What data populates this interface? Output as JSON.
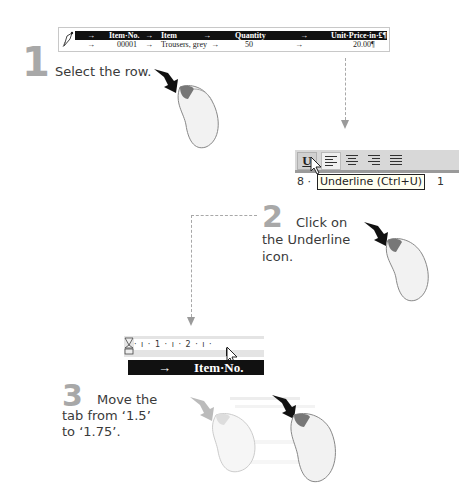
{
  "step1": {
    "number": "1",
    "instruction": "Select the row.",
    "table": {
      "header": {
        "tab1": "→",
        "item_no": "Item·No.",
        "tab2": "→",
        "item": "Item",
        "tab3": "→",
        "quantity": "Quantity",
        "tab4": "→",
        "unit_price": "Unit·Price·in·£¶"
      },
      "row": {
        "tab1": "→",
        "item_no": "00001",
        "tab2": "→",
        "item": "Trousers, grey",
        "tab3": "→",
        "quantity": "50",
        "tab4": "→",
        "unit_price": "20.00¶"
      }
    }
  },
  "step2": {
    "number": "2",
    "instruction_line1": "Click on",
    "instruction_line2": "the Underline",
    "instruction_line3": "icon.",
    "toolbar": {
      "underline_label": "U",
      "ruler_left": "8 ·",
      "ruler_right": "1",
      "tooltip": "Underline (Ctrl+U)"
    }
  },
  "step3": {
    "number": "3",
    "instruction_line1": "Move the",
    "instruction_line2": "tab from ‘1.5’",
    "instruction_line3": "to ‘1.75’.",
    "ruler_marks": "· ı · 1 · ı · 2 · ı ·",
    "bar_arrow": "→",
    "bar_text": "Item·No."
  },
  "colors": {
    "step_number": "#a8a8a8",
    "table_header_bg": "#111111",
    "connector": "#a8a8a8"
  }
}
